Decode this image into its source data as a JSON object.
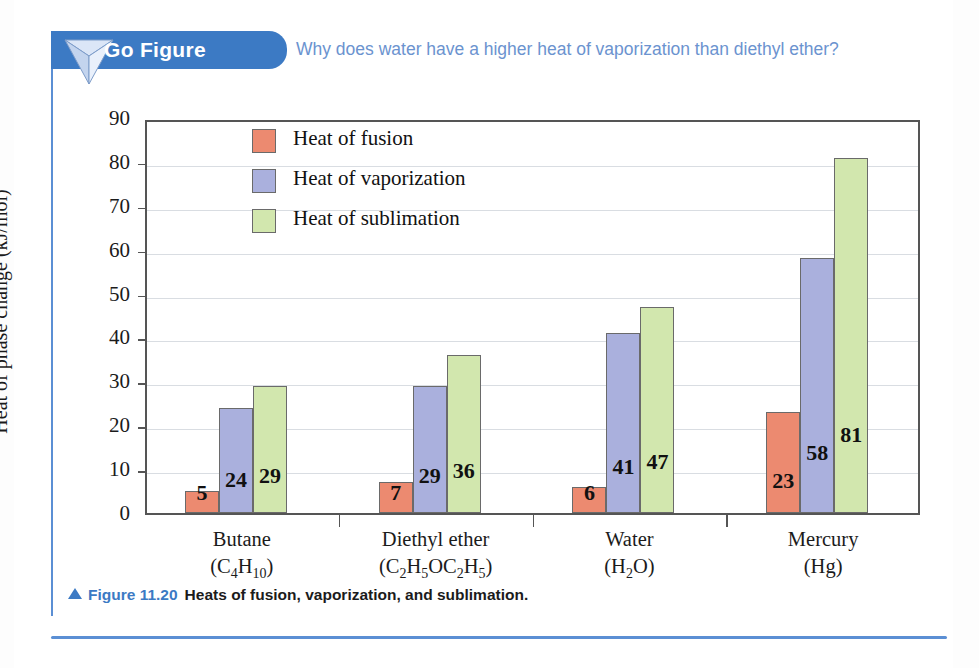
{
  "go_figure": {
    "banner_label": "Go Figure",
    "icon": "inverted-pyramid-icon",
    "question": "Why does water have a higher heat of vaporization than diethyl ether?",
    "banner_color": "#3c7ac4",
    "question_color": "#6b93cf"
  },
  "caption": {
    "marker": "triangle-up-icon",
    "figure_number": "Figure 11.20",
    "text": "Heats of fusion, vaporization, and sublimation."
  },
  "chart_data": {
    "type": "bar",
    "title": "Heats of fusion, vaporization, and sublimation.",
    "xlabel": "",
    "ylabel": "Heat of phase change (kJ/mol)",
    "ylim": [
      0,
      90
    ],
    "yticks": [
      0,
      10,
      20,
      30,
      40,
      50,
      60,
      70,
      80,
      90
    ],
    "ytick_labels": [
      "0",
      "10",
      "20",
      "30",
      "40",
      "50",
      "60",
      "70",
      "80",
      "90"
    ],
    "grid": true,
    "legend_position": "upper left inside",
    "categories": [
      "Butane",
      "Diethyl ether",
      "Water",
      "Mercury"
    ],
    "category_formulas": [
      "(C4H10)",
      "(C2H5OC2H5)",
      "(H2O)",
      "(Hg)"
    ],
    "series": [
      {
        "name": "Heat of fusion",
        "color": "#ec8a70",
        "values": [
          5,
          7,
          6,
          23
        ],
        "labels": [
          "5",
          "7",
          "6",
          "23"
        ]
      },
      {
        "name": "Heat of vaporization",
        "color": "#aab0dd",
        "values": [
          24,
          29,
          41,
          58
        ],
        "labels": [
          "24",
          "29",
          "41",
          "58"
        ]
      },
      {
        "name": "Heat of sublimation",
        "color": "#d2e7ae",
        "values": [
          29,
          36,
          47,
          81
        ],
        "labels": [
          "29",
          "36",
          "47",
          "81"
        ]
      }
    ]
  }
}
